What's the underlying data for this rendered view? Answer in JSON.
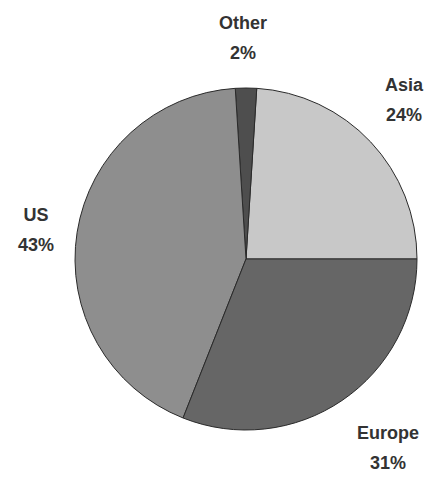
{
  "chart_data": {
    "type": "pie",
    "title": "",
    "categories": [
      "Asia",
      "Europe",
      "US",
      "Other"
    ],
    "values": [
      24,
      31,
      43,
      2
    ],
    "unit": "%",
    "start_angle_deg": 0,
    "direction": "clockwise from 3 o'clock going counter-clockwise order: Asia top-right, Europe bottom-right, US left, Other top",
    "colors": {
      "Asia": "#c8c8c8",
      "Europe": "#666666",
      "US": "#8e8e8e",
      "Other": "#4e4e4e"
    },
    "legend": "none (data labels on slices)",
    "slices": [
      {
        "name": "Asia",
        "value": 24,
        "label": "Asia",
        "pct_label": "24%"
      },
      {
        "name": "Europe",
        "value": 31,
        "label": "Europe",
        "pct_label": "31%"
      },
      {
        "name": "US",
        "value": 43,
        "label": "US",
        "pct_label": "43%"
      },
      {
        "name": "Other",
        "value": 2,
        "label": "Other",
        "pct_label": "2%"
      }
    ]
  }
}
